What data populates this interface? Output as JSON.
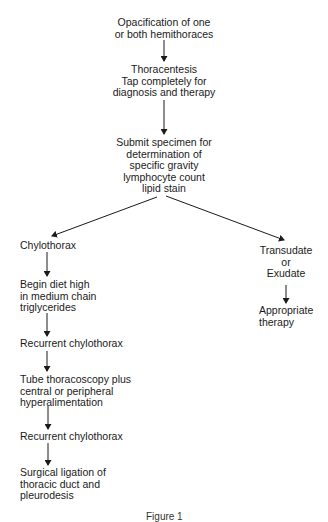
{
  "diagram": {
    "type": "flowchart",
    "nodes": {
      "n1": {
        "lines": [
          "Opacification of one",
          "or both hemithoraces"
        ]
      },
      "n2": {
        "lines": [
          "Thoracentesis",
          "Tap completely for",
          "diagnosis and therapy"
        ]
      },
      "n3": {
        "lines": [
          "Submit specimen for",
          "determination of",
          "specific gravity",
          "lymphocyte count",
          "lipid stain"
        ]
      },
      "n4": {
        "lines": [
          "Chylothorax"
        ]
      },
      "n5": {
        "lines": [
          "Transudate",
          "or",
          "Exudate"
        ]
      },
      "n6": {
        "lines": [
          "Appropriate",
          "therapy"
        ]
      },
      "n7": {
        "lines": [
          "Begin diet high",
          "in medium chain",
          "triglycerides"
        ]
      },
      "n8": {
        "lines": [
          "Recurrent chylothorax"
        ]
      },
      "n9": {
        "lines": [
          "Tube thoracoscopy plus",
          "central or peripheral",
          "hyperalimentation"
        ]
      },
      "n10": {
        "lines": [
          "Recurrent chylothorax"
        ]
      },
      "n11": {
        "lines": [
          "Surgical ligation of",
          "thoracic duct and",
          "pleurodesis"
        ]
      }
    },
    "edges": [
      [
        "n1",
        "n2"
      ],
      [
        "n2",
        "n3"
      ],
      [
        "n3",
        "n4"
      ],
      [
        "n3",
        "n5"
      ],
      [
        "n5",
        "n6"
      ],
      [
        "n4",
        "n7"
      ],
      [
        "n7",
        "n8"
      ],
      [
        "n8",
        "n9"
      ],
      [
        "n9",
        "n10"
      ],
      [
        "n10",
        "n11"
      ]
    ],
    "caption": "Figure 1"
  },
  "colors": {
    "ink": "#1a1a1a",
    "background": "#ffffff"
  }
}
